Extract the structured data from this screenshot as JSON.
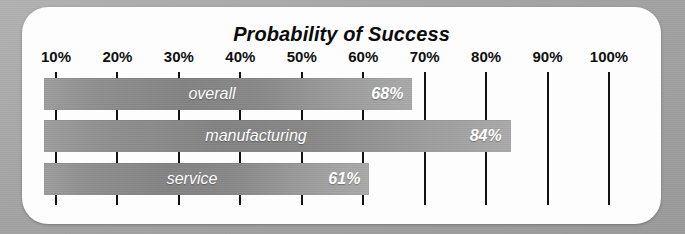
{
  "chart_data": {
    "type": "bar",
    "orientation": "horizontal",
    "title": "Probability of Success",
    "xlabel": "",
    "ylabel": "",
    "xlim": [
      0,
      105
    ],
    "grid": true,
    "legend": "none",
    "categories": [
      "overall",
      "manufacturing",
      "service"
    ],
    "values": [
      68,
      84,
      61
    ],
    "value_labels": [
      "68%",
      "84%",
      "61%"
    ],
    "tick_values": [
      10,
      20,
      30,
      40,
      50,
      60,
      70,
      80,
      90,
      100
    ],
    "tick_labels": [
      "10%",
      "20%",
      "30%",
      "40%",
      "50%",
      "60%",
      "70%",
      "80%",
      "90%",
      "100%"
    ],
    "bars": [
      {
        "name": "overall",
        "value": 68,
        "value_label": "68%",
        "series_label": "overall"
      },
      {
        "name": "manufacturing",
        "value": 84,
        "value_label": "84%",
        "series_label": "manufacturing"
      },
      {
        "name": "service",
        "value": 61,
        "value_label": "61%",
        "series_label": "service"
      }
    ]
  },
  "colors": {
    "page_background": "#a9a9a9",
    "panel_background": "#fdfdfd",
    "bar_fill_dark": "#828282",
    "bar_fill_light": "#a9a9a9",
    "gridline": "#121212",
    "title_text": "#0b0b0b",
    "tick_text": "#101010",
    "bar_text": "#ffffff"
  }
}
